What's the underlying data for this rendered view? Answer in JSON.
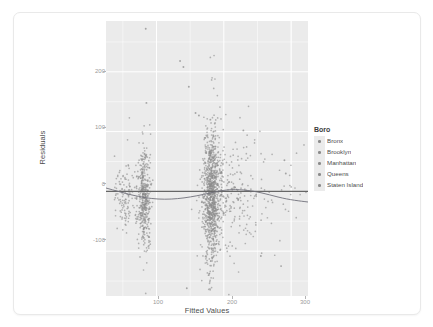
{
  "chart_data": {
    "type": "scatter",
    "title": "",
    "subtitle": "",
    "xlabel": "Fitted Values",
    "ylabel": "Residuals",
    "xlim": [
      25,
      325
    ],
    "ylim": [
      -175,
      285
    ],
    "xticks": [
      100,
      200,
      300
    ],
    "xtick_labels": [
      "100",
      "200",
      "300"
    ],
    "yticks": [
      200,
      100,
      0,
      -100
    ],
    "ytick_labels": [
      "200",
      "100",
      "0",
      "-100"
    ],
    "grid": true,
    "grid_color": "#ffffff",
    "panel_background": "#ebebeb",
    "point_color": "#8c8c8c",
    "legend_position": "right",
    "reference_line": {
      "type": "horizontal",
      "y": 0,
      "color": "#666666"
    },
    "smooth_line": {
      "type": "loess",
      "color": "#737373"
    },
    "legend": {
      "title": "Boro",
      "entries": [
        {
          "label": "Bronx",
          "color": "#8c8c8c"
        },
        {
          "label": "Brooklyn",
          "color": "#8c8c8c"
        },
        {
          "label": "Manhattan",
          "color": "#8c8c8c"
        },
        {
          "label": "Queens",
          "color": "#8c8c8c"
        },
        {
          "label": "Staten Island",
          "color": "#8c8c8c"
        }
      ]
    },
    "clusters": [
      {
        "name": "Bronx",
        "x_center": 52,
        "x_spread": 9,
        "y_center": -6,
        "y_spread": 26,
        "n": 120
      },
      {
        "name": "Brooklyn",
        "x_center": 82,
        "x_spread": 5,
        "y_center": -10,
        "y_spread": 40,
        "n": 420
      },
      {
        "name": "Manhattan",
        "x_center": 182,
        "x_spread": 6,
        "y_center": -8,
        "y_spread": 55,
        "n": 900
      },
      {
        "name": "Queens",
        "x_center": 205,
        "x_spread": 22,
        "y_center": -12,
        "y_spread": 48,
        "n": 230
      },
      {
        "name": "Staten Island",
        "x_center": 255,
        "x_spread": 35,
        "y_center": -14,
        "y_spread": 45,
        "n": 60
      }
    ],
    "notable_outliers": [
      {
        "x": 84,
        "y": 272
      },
      {
        "x": 135,
        "y": 218
      },
      {
        "x": 140,
        "y": 208
      },
      {
        "x": 148,
        "y": 175
      },
      {
        "x": 85,
        "y": 148
      },
      {
        "x": 163,
        "y": 127
      },
      {
        "x": 158,
        "y": 131
      },
      {
        "x": 180,
        "y": 120
      },
      {
        "x": 229,
        "y": 102
      },
      {
        "x": 290,
        "y": 52
      },
      {
        "x": 292,
        "y": 30
      },
      {
        "x": 145,
        "y": -162
      },
      {
        "x": 255,
        "y": -108
      },
      {
        "x": 285,
        "y": -125
      }
    ]
  }
}
